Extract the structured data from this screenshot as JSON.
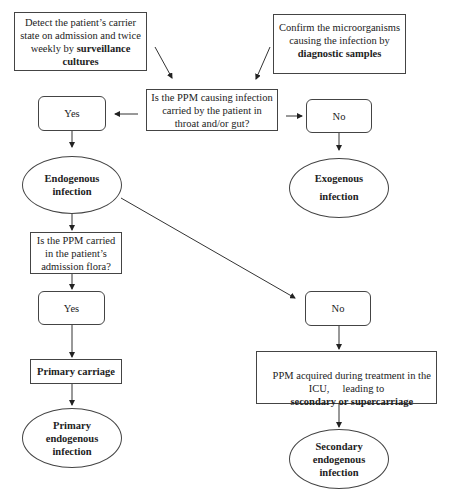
{
  "diagram": {
    "type": "flowchart",
    "nodes": {
      "surveillance": {
        "shape": "rectangle",
        "text_plain": "Detect the patient’s carrier state on admission and twice weekly by",
        "text_bold": "surveillance cultures"
      },
      "diagnostic": {
        "shape": "rectangle",
        "text_plain": "Confirm the microorganisms causing the infection by",
        "text_bold": "diagnostic samples"
      },
      "question_carried": {
        "shape": "rectangle",
        "text": "Is the PPM causing infection carried by the patient in throat and/or gut?"
      },
      "yes_1": {
        "shape": "rounded",
        "text": "Yes"
      },
      "no_1": {
        "shape": "rounded",
        "text": "No"
      },
      "endogenous": {
        "shape": "ellipse",
        "line1": "Endogenous",
        "line2": "infection"
      },
      "exogenous": {
        "shape": "ellipse",
        "line1": "Exogenous",
        "line2": "infection"
      },
      "question_flora": {
        "shape": "rectangle",
        "text": "Is the PPM carried in the patient’s admission flora?"
      },
      "yes_2": {
        "shape": "rounded",
        "text": "Yes"
      },
      "no_2": {
        "shape": "rounded",
        "text": "No"
      },
      "primary_carriage": {
        "shape": "rectangle",
        "text": "Primary carriage"
      },
      "secondary_carriage": {
        "shape": "rectangle",
        "text_plain": "PPM acquired during treatment in the ICU,     leading to",
        "text_bold": "secondary or supercarriage"
      },
      "primary_endogenous": {
        "shape": "ellipse",
        "line1": "Primary",
        "line2": "endogenous",
        "line3": "infection"
      },
      "secondary_endogenous": {
        "shape": "ellipse",
        "line1": "Secondary",
        "line2": "endogenous",
        "line3": "infection"
      }
    },
    "edges": [
      {
        "from": "surveillance",
        "to": "question_carried"
      },
      {
        "from": "diagnostic",
        "to": "question_carried"
      },
      {
        "from": "question_carried",
        "to": "yes_1"
      },
      {
        "from": "question_carried",
        "to": "no_1"
      },
      {
        "from": "yes_1",
        "to": "endogenous"
      },
      {
        "from": "no_1",
        "to": "exogenous"
      },
      {
        "from": "endogenous",
        "to": "question_flora"
      },
      {
        "from": "endogenous",
        "to": "no_2"
      },
      {
        "from": "question_flora",
        "to": "yes_2"
      },
      {
        "from": "yes_2",
        "to": "primary_carriage"
      },
      {
        "from": "primary_carriage",
        "to": "primary_endogenous"
      },
      {
        "from": "no_2",
        "to": "secondary_carriage"
      },
      {
        "from": "secondary_carriage",
        "to": "secondary_endogenous"
      }
    ],
    "colors": {
      "line": "#333333",
      "background": "#ffffff",
      "text": "#222222"
    }
  }
}
